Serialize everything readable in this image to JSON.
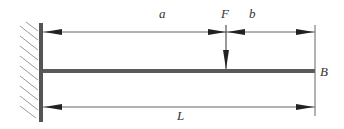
{
  "diagram": {
    "labels": {
      "a": "a",
      "F": "F",
      "b": "b",
      "B": "B",
      "L": "L"
    },
    "colors": {
      "beam": "#555555",
      "lines": "#444444",
      "hatch": "#999999",
      "background": "#ffffff"
    }
  }
}
